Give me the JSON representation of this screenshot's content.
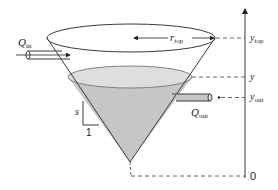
{
  "diagram": {
    "labels": {
      "inflow": {
        "main": "Q",
        "sub": "in"
      },
      "outflow": {
        "main": "Q",
        "sub": "out"
      },
      "radius": {
        "main": "r",
        "sub": "top"
      },
      "slope_rise": "s",
      "slope_run": "1"
    },
    "axis": {
      "ticks": [
        {
          "id": "y_top",
          "main": "y",
          "sub": "top"
        },
        {
          "id": "y",
          "main": "y",
          "sub": ""
        },
        {
          "id": "y_out",
          "main": "y",
          "sub": "out"
        },
        {
          "id": "zero",
          "main": "0",
          "sub": ""
        }
      ]
    },
    "colors": {
      "stroke": "#3a3a3a",
      "liquid": "#c8c8c8",
      "liquid_surface": "#dcdcdc",
      "dash": "#555555"
    }
  }
}
